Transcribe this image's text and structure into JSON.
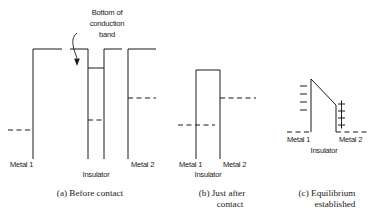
{
  "figure": {
    "annotation": {
      "line1": "Bottom of",
      "line2": "conduction",
      "line3": "band"
    },
    "panels": [
      {
        "id": "a",
        "caption_line1": "(a) Before contact",
        "caption_line2": "",
        "labels": {
          "left_metal": "Metal 1",
          "insulator": "Insulator",
          "right_metal": "Metal 2"
        }
      },
      {
        "id": "b",
        "caption_line1": "(b) Just after",
        "caption_line2": "contact",
        "labels": {
          "left_metal": "Metal 1",
          "insulator": "Insulator",
          "right_metal": "Metal 2"
        }
      },
      {
        "id": "c",
        "caption_line1": "(c) Equilibrium",
        "caption_line2": "established",
        "labels": {
          "left_metal": "Metal 1",
          "insulator": "Insulator",
          "right_metal": "Metal 2"
        },
        "charges": {
          "negative_symbol": "–",
          "negative_count": 4,
          "positive_symbol": "+",
          "positive_count": 4
        }
      }
    ],
    "colors": {
      "ink": "#1a1a1a",
      "background": "#ffffff"
    }
  }
}
